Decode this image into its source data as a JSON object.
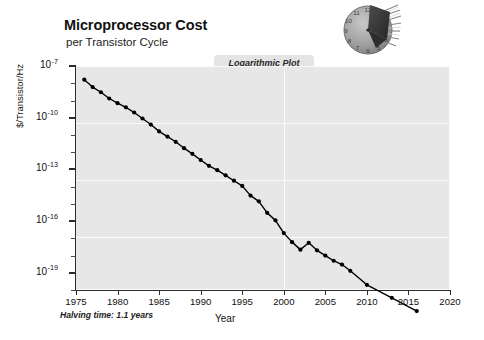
{
  "header": {
    "title": "Microprocessor Cost",
    "subtitle": "per Transistor Cycle"
  },
  "badge": {
    "label": "Logarithmic Plot"
  },
  "logo": {
    "name": "clock-chip-logo",
    "clock_numerals": [
      "12",
      "11",
      "10",
      "9",
      "8",
      "7",
      "6",
      "5",
      "4"
    ],
    "face_color": "#9a9a9a",
    "chip_color": "#3a3a3a"
  },
  "footnote": {
    "text": "Halving time: 1.1 years"
  },
  "colors": {
    "plot_background": "#e7e7e7",
    "gridline": "#fbfbfb",
    "axis": "#2c2c2c",
    "series": "#000000",
    "page_background": "#ffffff"
  },
  "chart_data": {
    "type": "line",
    "title": "Microprocessor Cost",
    "subtitle": "per Transistor Cycle",
    "xlabel": "Year",
    "ylabel": "$/Transistor/Hz",
    "annotation": "Halving time: 1.1 years",
    "badge": "Logarithmic Plot",
    "yscale": "log",
    "xlim": [
      1975,
      2020
    ],
    "ylim": [
      1e-20,
      1e-07
    ],
    "xticks": [
      1975,
      1980,
      1985,
      1990,
      1995,
      2000,
      2005,
      2010,
      2015,
      2020
    ],
    "xticklabels": [
      "1975",
      "1980",
      "1985",
      "1990",
      "1995",
      "2000",
      "2005",
      "2010",
      "2015",
      "2020"
    ],
    "yticks": [
      1e-07,
      1e-10,
      1e-13,
      1e-16,
      1e-19
    ],
    "yticklabels": [
      "10-7",
      "10-10",
      "10-13",
      "10-16",
      "10-19"
    ],
    "ytick_exponents": [
      "-7",
      "-10",
      "-13",
      "-16",
      "-19"
    ],
    "grid": true,
    "grid_color": "#fbfbfb",
    "legend": null,
    "marker": "filled-circle",
    "series": [
      {
        "name": "Microprocessor cost per transistor cycle",
        "color": "#000000",
        "x": [
          1976,
          1977,
          1978,
          1979,
          1980,
          1981,
          1982,
          1983,
          1984,
          1985,
          1986,
          1987,
          1988,
          1989,
          1990,
          1991,
          1992,
          1993,
          1994,
          1995,
          1996,
          1997,
          1998,
          1999,
          2000,
          2001,
          2002,
          2003,
          2004,
          2005,
          2006,
          2007,
          2008,
          2010,
          2013,
          2016
        ],
        "y": [
          1.6e-08,
          6e-09,
          3e-09,
          1.3e-09,
          7e-10,
          4e-10,
          2e-10,
          9e-11,
          4e-11,
          1.6e-11,
          8e-12,
          4e-12,
          1.7e-12,
          8e-13,
          3.5e-13,
          1.6e-13,
          9e-14,
          4.5e-14,
          2.2e-14,
          1.1e-14,
          3e-15,
          1.4e-15,
          3e-16,
          1.1e-16,
          2e-17,
          6e-18,
          2.2e-18,
          5.5e-18,
          2e-18,
          1e-18,
          5e-19,
          3e-19,
          1.3e-19,
          2e-20,
          3.5e-21,
          6e-22
        ]
      }
    ]
  }
}
